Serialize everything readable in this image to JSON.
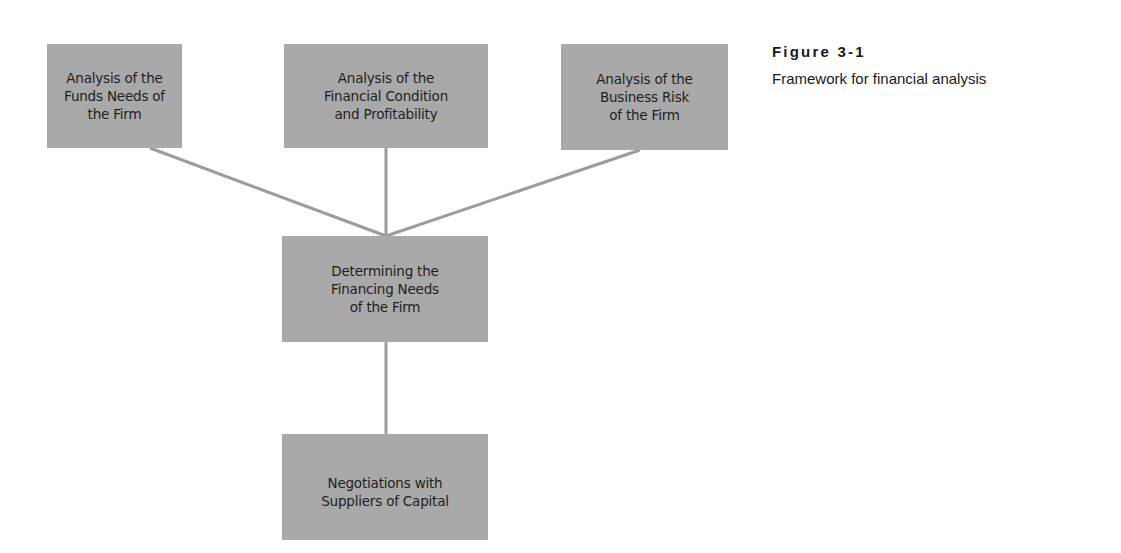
{
  "figure": {
    "number": "Figure 3-1",
    "title": "Framework for financial analysis"
  },
  "colors": {
    "box_fill": "#a9a9a9",
    "connector": "#9c9c9c",
    "text": "#1e1e1e"
  },
  "diagram": {
    "top_row": [
      {
        "id": "funds-needs",
        "label": "Analysis of the\nFunds Needs of\nthe Firm"
      },
      {
        "id": "financial-condition",
        "label": "Analysis of the\nFinancial Condition\nand Profitability"
      },
      {
        "id": "business-risk",
        "label": "Analysis of the\nBusiness Risk\nof the Firm"
      }
    ],
    "middle": {
      "id": "financing-needs",
      "label": "Determining the\nFinancing Needs\nof the Firm"
    },
    "bottom": {
      "id": "negotiations",
      "label": "Negotiations with\nSuppliers of Capital"
    },
    "edges": [
      {
        "from": "funds-needs",
        "to": "financing-needs"
      },
      {
        "from": "financial-condition",
        "to": "financing-needs"
      },
      {
        "from": "business-risk",
        "to": "financing-needs"
      },
      {
        "from": "financing-needs",
        "to": "negotiations"
      }
    ]
  }
}
